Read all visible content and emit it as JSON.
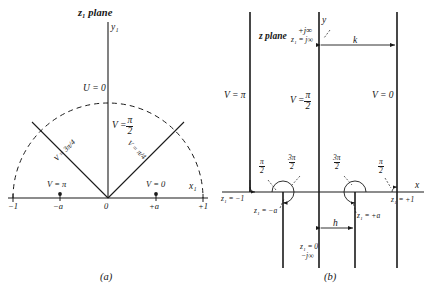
{
  "figure": {
    "captions": {
      "left": "(a)",
      "right": "(b)"
    }
  },
  "panel_a": {
    "title": "z₁ plane",
    "y_axis_label": "y₁",
    "x_axis_label": "x₁",
    "potential_labels": {
      "top_arc": "U = 0",
      "center_vertical": "V =",
      "center_vertical_value_num": "π",
      "center_vertical_value_den": "2",
      "left_diagonal": "V = 3π/4",
      "right_diagonal": "V = π/4",
      "left_axis": "V = π",
      "right_axis": "V = 0"
    },
    "x_ticks": [
      "−1",
      "−a",
      "0",
      "+a",
      "+1"
    ],
    "marked_points": [
      "−a",
      "+a"
    ]
  },
  "panel_b": {
    "title": "z plane",
    "y_axis_label": "y",
    "x_axis_label": "x",
    "vertical_lines": [
      {
        "label": "V = π",
        "value_num": "",
        "value_den": ""
      },
      {
        "label": "V =",
        "value_num": "π",
        "value_den": "2"
      },
      {
        "label": "V = 0",
        "value_num": "",
        "value_den": ""
      }
    ],
    "top_labels": {
      "plus_j_inf": "+j∞",
      "z1_j_inf": "z₁ = j∞"
    },
    "bottom_labels": {
      "z1_zero": "z₁ = 0",
      "minus_j_inf": "−j∞"
    },
    "dimensions": {
      "k": "k",
      "h": "h"
    },
    "angle_labels": {
      "left_quarter_num": "π",
      "left_quarter_den": "2",
      "left_three_quarter_num": "3π",
      "left_three_quarter_den": "2",
      "right_three_quarter_num": "3π",
      "right_three_quarter_den": "2",
      "right_quarter_num": "π",
      "right_quarter_den": "2"
    },
    "point_labels": {
      "z1_minus_one": "z₁ = −1",
      "z1_minus_a": "z₁ = −a",
      "z1_plus_a": "z₁ = +a",
      "z1_plus_one": "z₁ = +1"
    }
  },
  "colors": {
    "ink": "#1a1a1a",
    "paper": "#ffffff"
  }
}
